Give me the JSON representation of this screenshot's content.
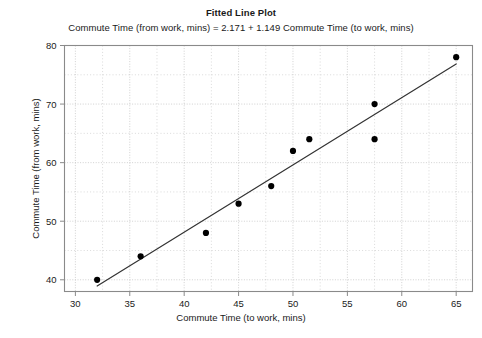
{
  "chart_data": {
    "type": "scatter",
    "title": "Fitted Line Plot",
    "subtitle": "Commute Time (from work, mins) = 2.171 + 1.149 Commute Time (to work, mins)",
    "xlabel": "Commute Time (to work, mins)",
    "ylabel": "Commute Time (from work, mins)",
    "xlim": [
      29,
      66.5
    ],
    "ylim": [
      38,
      80
    ],
    "xticks": [
      30,
      35,
      40,
      45,
      50,
      55,
      60,
      65
    ],
    "yticks": [
      40,
      50,
      60,
      70,
      80
    ],
    "xtick_labels": [
      "30",
      "35",
      "40",
      "45",
      "50",
      "55",
      "60",
      "65"
    ],
    "ytick_labels": [
      "40",
      "50",
      "60",
      "70",
      "80"
    ],
    "x_minor_step": 2.5,
    "y_minor_step": 5,
    "grid": true,
    "legend": null,
    "points": [
      {
        "x": 32,
        "y": 40
      },
      {
        "x": 36,
        "y": 44
      },
      {
        "x": 42,
        "y": 48
      },
      {
        "x": 45,
        "y": 53
      },
      {
        "x": 48,
        "y": 56
      },
      {
        "x": 50,
        "y": 62
      },
      {
        "x": 51.5,
        "y": 64
      },
      {
        "x": 57.5,
        "y": 70
      },
      {
        "x": 57.5,
        "y": 64
      },
      {
        "x": 65,
        "y": 78
      }
    ],
    "fit_line": {
      "intercept": 2.171,
      "slope": 1.149,
      "x_start": 32,
      "x_end": 65
    },
    "colors": {
      "marker": "#000000",
      "line": "#333333",
      "grid": "#b9b9b9",
      "axis": "#8a8a8a",
      "text": "#1a1a1a",
      "background": "#ffffff"
    }
  }
}
